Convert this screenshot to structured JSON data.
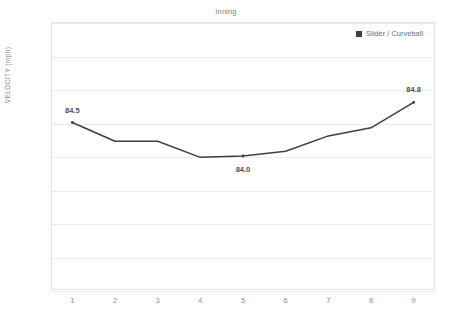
{
  "top_caption": "",
  "chart_title": "Inning",
  "y_axis_title": "VELOCITY (mph)",
  "legend": {
    "label": "Slider / Curveball",
    "color": "#404040"
  },
  "colors": {
    "line": "#3f3f3f",
    "grid": "#ececec",
    "frame": "#e3e3e3",
    "tick_text": "#8c8c8c",
    "label_text": "#4d4d4d"
  },
  "chart_data": {
    "type": "line",
    "title": "Inning",
    "xlabel": "Inning",
    "ylabel": "VELOCITY (mph)",
    "ylim": [
      82.0,
      86.0
    ],
    "ytick_step": 0.5,
    "yticks": [
      "86.0",
      "85.5",
      "85.0",
      "84.5",
      "84.0",
      "83.5",
      "83.0",
      "82.5",
      "82.0"
    ],
    "ytick_values": [
      86.0,
      85.5,
      85.0,
      84.5,
      84.0,
      83.5,
      83.0,
      82.5,
      82.0
    ],
    "categories": [
      "1",
      "2",
      "3",
      "4",
      "5",
      "6",
      "7",
      "8",
      "9"
    ],
    "x": [
      1,
      2,
      3,
      4,
      5,
      6,
      7,
      8,
      9
    ],
    "grid": "horizontal",
    "legend_position": "top-right",
    "series": [
      {
        "name": "Slider / Curveball",
        "color": "#3f3f3f",
        "values": [
          84.5,
          84.22,
          84.22,
          83.98,
          84.0,
          84.07,
          84.3,
          84.42,
          84.8
        ]
      }
    ],
    "annotations": [
      {
        "x": 1,
        "y": 84.5,
        "text": "84.5",
        "position": "above"
      },
      {
        "x": 5,
        "y": 84.0,
        "text": "84.0",
        "position": "below"
      },
      {
        "x": 9,
        "y": 84.8,
        "text": "84.8",
        "position": "above"
      }
    ]
  }
}
